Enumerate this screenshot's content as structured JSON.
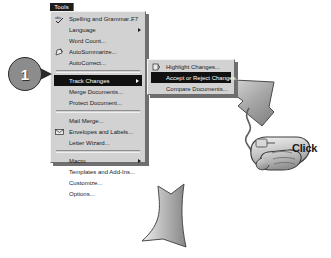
{
  "menu": {
    "title": "Tools",
    "title_mnemonic": "T",
    "items": [
      {
        "label": "Spelling and Grammar...",
        "mnemonic": "S",
        "accel": "F7",
        "icon": "spell-check-icon",
        "submenu": false,
        "selected": false
      },
      {
        "label": "Language",
        "mnemonic": "L",
        "accel": "",
        "icon": "",
        "submenu": true,
        "selected": false
      },
      {
        "label": "Word Count...",
        "mnemonic": "W",
        "accel": "",
        "icon": "",
        "submenu": false,
        "selected": false
      },
      {
        "label": "AutoSummarize...",
        "mnemonic": "u",
        "accel": "",
        "icon": "auto-summarize-icon",
        "submenu": false,
        "selected": false
      },
      {
        "label": "AutoCorrect...",
        "mnemonic": "A",
        "accel": "",
        "icon": "",
        "submenu": false,
        "selected": false
      },
      {
        "separator": true
      },
      {
        "label": "Track Changes",
        "mnemonic": "T",
        "accel": "",
        "icon": "",
        "submenu": true,
        "selected": true
      },
      {
        "label": "Merge Documents...",
        "mnemonic": "D",
        "accel": "",
        "icon": "",
        "submenu": false,
        "selected": false
      },
      {
        "label": "Protect Document...",
        "mnemonic": "r",
        "accel": "",
        "icon": "",
        "submenu": false,
        "selected": false
      },
      {
        "separator": true
      },
      {
        "label": "Mail Merge...",
        "mnemonic": "M",
        "accel": "",
        "icon": "",
        "submenu": false,
        "selected": false
      },
      {
        "label": "Envelopes and Labels...",
        "mnemonic": "E",
        "accel": "",
        "icon": "envelope-icon",
        "submenu": false,
        "selected": false
      },
      {
        "label": "Letter Wizard...",
        "mnemonic": "W",
        "accel": "",
        "icon": "",
        "submenu": false,
        "selected": false
      },
      {
        "separator": true
      },
      {
        "label": "Macro",
        "mnemonic": "M",
        "accel": "",
        "icon": "",
        "submenu": true,
        "selected": false
      },
      {
        "label": "Templates and Add-Ins...",
        "mnemonic": "I",
        "accel": "",
        "icon": "",
        "submenu": false,
        "selected": false
      },
      {
        "label": "Customize...",
        "mnemonic": "C",
        "accel": "",
        "icon": "",
        "submenu": false,
        "selected": false
      },
      {
        "label": "Options...",
        "mnemonic": "O",
        "accel": "",
        "icon": "",
        "submenu": false,
        "selected": false
      }
    ]
  },
  "submenu": {
    "items": [
      {
        "label": "Highlight Changes...",
        "mnemonic": "H",
        "icon": "highlight-changes-icon",
        "selected": false
      },
      {
        "label": "Accept or Reject Changes...",
        "mnemonic": "A",
        "icon": "",
        "selected": true
      },
      {
        "label": "Compare Documents...",
        "mnemonic": "C",
        "icon": "",
        "selected": false
      }
    ]
  },
  "callout": {
    "step_number": "1"
  },
  "annotations": {
    "click_label": "Click"
  },
  "colors": {
    "menu_face": "#d2d2d2",
    "menu_shadow": "#6f6f6f",
    "highlight": "#111111",
    "highlight_text": "#ffffff",
    "arrow_fill": "#9a9a9a",
    "arrow_stroke": "#1a1a1a",
    "badge_fill": "#8c8c8c"
  }
}
